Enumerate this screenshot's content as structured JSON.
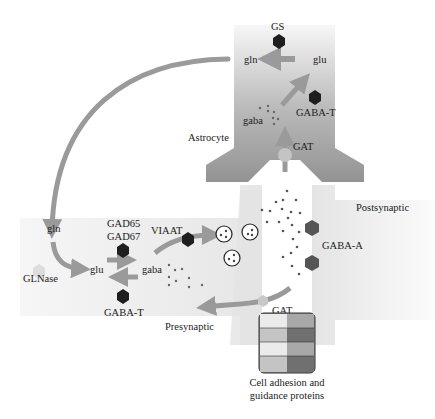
{
  "diagram": {
    "regions": {
      "astrocyte": "Astrocyte",
      "presynaptic": "Presynaptic",
      "postsynaptic": "Postsynaptic"
    },
    "astrocyte": {
      "enzyme_gs": "GS",
      "gln": "gln",
      "glu": "glu",
      "gaba": "gaba",
      "enzyme_gabat": "GABA-T",
      "transporter": "GAT"
    },
    "presynaptic": {
      "gln": "gln",
      "glnase": "GLNase",
      "glu": "glu",
      "gad65": "GAD65",
      "gad67": "GAD67",
      "gaba": "gaba",
      "gabat": "GABA-T",
      "viaat": "VIAAT",
      "transporter": "GAT"
    },
    "postsynaptic": {
      "receptor": "GABA-A"
    },
    "adhesion": {
      "line1": "Cell adhesion and",
      "line2": "guidance proteins"
    },
    "colors": {
      "arrow": "#9a9a9a",
      "astrocyte_top": "#f2f2f2",
      "astrocyte_bottom": "#8f8f8f",
      "neuron": "#ececec",
      "enzyme": "#222222",
      "receptor": "#555555",
      "glnase": "#dcdcdc"
    }
  }
}
